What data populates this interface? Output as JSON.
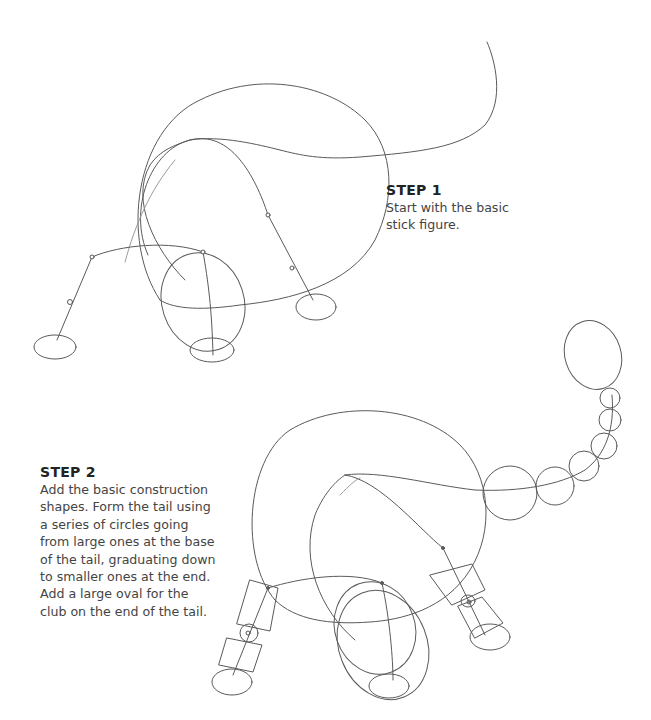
{
  "page": {
    "background": "#ffffff",
    "ink_color": "#5a5a5a"
  },
  "steps": [
    {
      "title": "STEP 1",
      "lines": [
        "Start with the basic",
        "stick figure."
      ]
    },
    {
      "title": "STEP 2",
      "lines": [
        "Add the basic construction",
        "shapes. Form the tail using",
        "a series of circles going",
        "from large ones at the base",
        "of the tail, graduating down",
        "to smaller ones at the end.",
        "Add a large oval for the",
        "club on the end of the tail."
      ]
    }
  ],
  "illustrations": [
    {
      "name": "step-1-stick-figure",
      "description": "Dinosaur stick figure with body circle, neck/head curve, tail line and four legs with oval feet"
    },
    {
      "name": "step-2-construction-shapes",
      "description": "Dinosaur with body circle, head ovals, cylinder leg segments, tail of graduating circles ending in a large oval club"
    }
  ]
}
